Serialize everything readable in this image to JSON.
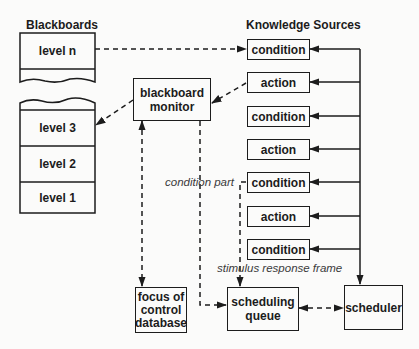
{
  "diagram": {
    "type": "blackboard-architecture",
    "headings": {
      "blackboards": "Blackboards",
      "knowledge_sources": "Knowledge Sources"
    },
    "blackboard_levels": [
      {
        "id": "level-n",
        "label": "level n"
      },
      {
        "id": "level-3",
        "label": "level 3"
      },
      {
        "id": "level-2",
        "label": "level 2"
      },
      {
        "id": "level-1",
        "label": "level 1"
      }
    ],
    "knowledge_sources": [
      {
        "label": "condition"
      },
      {
        "label": "action"
      },
      {
        "label": "condition"
      },
      {
        "label": "action"
      },
      {
        "label": "condition"
      },
      {
        "label": "action"
      },
      {
        "label": "condition"
      }
    ],
    "components": {
      "blackboard_monitor": "blackboard\nmonitor",
      "focus_of_control": "focus of\ncontrol\ndatabase",
      "scheduling_queue": "scheduling\nqueue",
      "scheduler": "scheduler"
    },
    "annotations": {
      "condition_part": "condition part",
      "stimulus_response_frame": "stimulus response frame"
    },
    "edges": [
      {
        "from": "level n",
        "to": "condition (KS 1)",
        "style": "dashed"
      },
      {
        "from": "action (KS 2)",
        "to": "blackboard monitor",
        "style": "dashed"
      },
      {
        "from": "blackboard monitor",
        "to": "level 3",
        "style": "dashed"
      },
      {
        "from": "blackboard monitor",
        "to": "focus of control database",
        "style": "dashed",
        "bidirectional": true
      },
      {
        "from": "blackboard monitor",
        "to": "scheduling queue",
        "style": "dashed"
      },
      {
        "from": "condition (KS 5)",
        "to": "scheduling queue",
        "style": "dashed",
        "label": "condition part / stimulus response frame"
      },
      {
        "from": "scheduling queue",
        "to": "scheduler",
        "style": "dashed",
        "bidirectional": true
      },
      {
        "from": "scheduler",
        "to": "all knowledge sources",
        "style": "solid"
      }
    ],
    "colors": {
      "ink": "#1c1c1c",
      "background": "#fbfbfa",
      "annotation": "#3a3a3a"
    }
  }
}
